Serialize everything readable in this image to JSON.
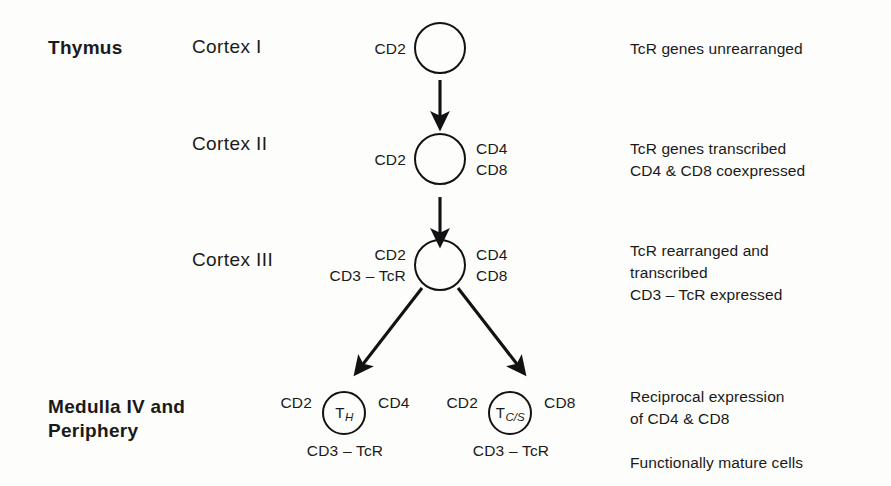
{
  "diagram": {
    "ink_color": "#121212",
    "background_color": "#fdfdfb"
  },
  "compartments": [
    {
      "name": "thymus",
      "label": "Thymus"
    },
    {
      "name": "medulla",
      "label": "Medulla IV and\nPeriphery"
    }
  ],
  "stages": [
    {
      "id": "cortex-1",
      "stage_label": "Cortex I",
      "left_markers": "CD2",
      "right_markers": "",
      "bottom_markers": "",
      "cell_label": "",
      "note": "TcR genes unrearranged"
    },
    {
      "id": "cortex-2",
      "stage_label": "Cortex II",
      "left_markers": "CD2",
      "right_markers": "CD4\nCD8",
      "bottom_markers": "",
      "cell_label": "",
      "note": "TcR genes transcribed\nCD4 & CD8 coexpressed"
    },
    {
      "id": "cortex-3",
      "stage_label": "Cortex III",
      "left_markers": "CD2\nCD3 – TcR",
      "right_markers": "CD4\nCD8",
      "bottom_markers": "",
      "cell_label": "",
      "note": "TcR rearranged and\n  transcribed\nCD3 – TcR expressed"
    }
  ],
  "mature_cells": [
    {
      "id": "th",
      "cell_symbol": "T",
      "cell_subscript": "H",
      "left_markers": "CD2",
      "right_markers": "CD4",
      "bottom_markers": "CD3 – TcR"
    },
    {
      "id": "tcs",
      "cell_symbol": "T",
      "cell_subscript": "C/S",
      "left_markers": "CD2",
      "right_markers": "CD8",
      "bottom_markers": "CD3 – TcR"
    }
  ],
  "mature_note": "Reciprocal expression\n   of CD4 & CD8\n\nFunctionally mature cells"
}
